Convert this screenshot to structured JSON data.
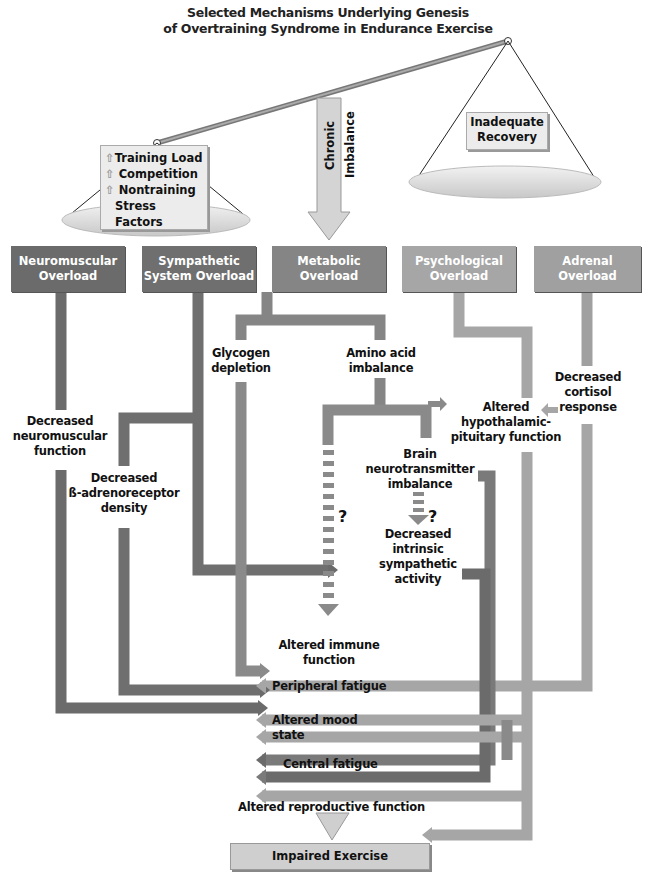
{
  "title": {
    "line1": "Selected Mechanisms Underlying Genesis",
    "line2": "of Overtraining Syndrome in Endurance Exercise"
  },
  "scale": {
    "left_pan": {
      "items": [
        {
          "icon": "up-arrow-icon",
          "label": "Training Load"
        },
        {
          "icon": "up-arrow-icon",
          "label": "Competition"
        },
        {
          "icon": "up-arrow-icon",
          "label": "Nontraining"
        }
      ],
      "continuation": "Stress Factors"
    },
    "right_pan": {
      "line1": "Inadequate",
      "line2": "Recovery"
    },
    "center_arrow": "Chronic Imbalance"
  },
  "headers": [
    {
      "line1": "Neuromuscular",
      "line2": "Overload",
      "color": "#6b6b6b"
    },
    {
      "line1": "Sympathetic",
      "line2": "System Overload",
      "color": "#6f6f6f"
    },
    {
      "line1": "Metabolic",
      "line2": "Overload",
      "color": "#858585"
    },
    {
      "line1": "Psychological",
      "line2": "Overload",
      "color": "#a6a6a6"
    },
    {
      "line1": "Adrenal",
      "line2": "Overload",
      "color": "#a0a0a0"
    }
  ],
  "nodes": {
    "glycogen": {
      "line1": "Glycogen",
      "line2": "depletion"
    },
    "amino": {
      "line1": "Amino acid",
      "line2": "imbalance"
    },
    "cortisol": {
      "line1": "Decreased",
      "line2": "cortisol",
      "line3": "response"
    },
    "hpa": {
      "line1": "Altered",
      "line2": "hypothalamic-",
      "line3": "pituitary function"
    },
    "neuromuscular": {
      "line1": "Decreased",
      "line2": "neuromuscular",
      "line3": "function"
    },
    "beta": {
      "line1": "Decreased",
      "line2": "ß-adrenoreceptor",
      "line3": "density"
    },
    "brain": {
      "line1": "Brain",
      "line2": "neurotransmitter",
      "line3": "imbalance"
    },
    "intrinsic": {
      "line1": "Decreased",
      "line2": "intrinsic",
      "line3": "sympathetic",
      "line4": "activity"
    },
    "immune": {
      "line1": "Altered immune",
      "line2": "function"
    },
    "question": "?"
  },
  "outcomes": {
    "peripheral": "Peripheral fatigue",
    "mood": "Altered mood state",
    "central": "Central fatigue",
    "reproductive": "Altered reproductive function"
  },
  "final": "Impaired Exercise Performance",
  "colors": {
    "dark": "#6b6b6b",
    "mid": "#858585",
    "light": "#a6a6a6",
    "pan": "#dcdcdc"
  }
}
